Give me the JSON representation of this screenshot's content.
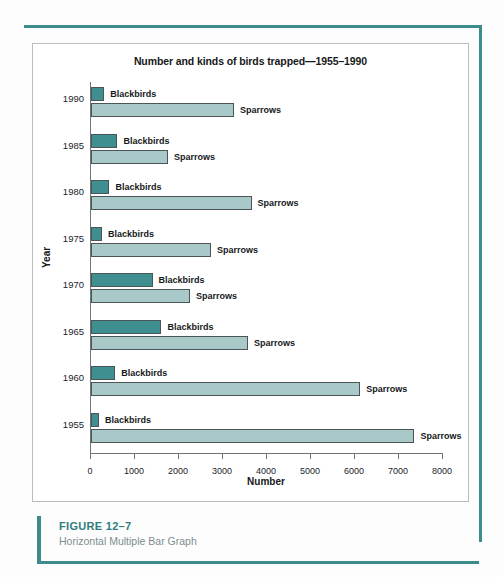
{
  "figure": {
    "caption_title": "FIGURE 12–7",
    "caption_subtitle": "Horizontal Multiple Bar Graph"
  },
  "colors": {
    "blackbirds": "#3f8f90",
    "sparrows": "#a9c9c8",
    "rule": "#3c8c8c",
    "caption_title": "#2e7d80",
    "caption_sub": "#7c8d90"
  },
  "chart_data": {
    "type": "bar",
    "orientation": "horizontal",
    "title": "Number and kinds of birds trapped—1955–1990",
    "xlabel": "Number",
    "ylabel": "Year",
    "xlim": [
      0,
      8000
    ],
    "xticks": [
      "0",
      "1000",
      "2000",
      "3000",
      "4000",
      "5000",
      "6000",
      "7000",
      "8000"
    ],
    "grid": false,
    "legend": "inline-labels",
    "categories": [
      "1990",
      "1985",
      "1980",
      "1975",
      "1970",
      "1965",
      "1960",
      "1955"
    ],
    "series": [
      {
        "name": "Blackbirds",
        "values": [
          300,
          600,
          420,
          250,
          1400,
          1600,
          550,
          180
        ]
      },
      {
        "name": "Sparrows",
        "values": [
          3250,
          1750,
          3650,
          2730,
          2250,
          3570,
          6120,
          7350
        ]
      }
    ],
    "rows": [
      {
        "year": "1990",
        "blackbirds": 300,
        "sparrows": 3250
      },
      {
        "year": "1985",
        "blackbirds": 600,
        "sparrows": 1750
      },
      {
        "year": "1980",
        "blackbirds": 420,
        "sparrows": 3650
      },
      {
        "year": "1975",
        "blackbirds": 250,
        "sparrows": 2730
      },
      {
        "year": "1970",
        "blackbirds": 1400,
        "sparrows": 2250
      },
      {
        "year": "1965",
        "blackbirds": 1600,
        "sparrows": 3570
      },
      {
        "year": "1960",
        "blackbirds": 550,
        "sparrows": 6120
      },
      {
        "year": "1955",
        "blackbirds": 180,
        "sparrows": 7350
      }
    ]
  }
}
